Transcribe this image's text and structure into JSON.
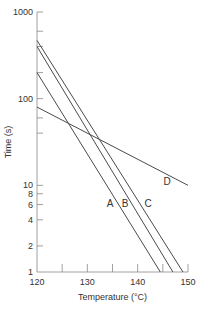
{
  "chart_data": {
    "type": "line",
    "title": "",
    "xlabel": "Temperature (°C)",
    "ylabel": "Time (s)",
    "xlim": [
      120,
      150
    ],
    "ylim": [
      1,
      1000
    ],
    "yscale": "log",
    "grid": false,
    "x_ticks": [
      120,
      125,
      130,
      135,
      140,
      145,
      150
    ],
    "x_tick_labels": [
      "120",
      "130",
      "140",
      "150"
    ],
    "y_tick_labels": [
      "1",
      "2",
      "4",
      "6",
      "8",
      "10",
      "100",
      "1000"
    ],
    "series": [
      {
        "name": "A",
        "x": [
          120,
          144.5
        ],
        "y": [
          200,
          1
        ]
      },
      {
        "name": "B",
        "x": [
          120,
          147
        ],
        "y": [
          400,
          1
        ]
      },
      {
        "name": "C",
        "x": [
          120,
          149
        ],
        "y": [
          470,
          1
        ]
      },
      {
        "name": "D",
        "x": [
          120,
          150
        ],
        "y": [
          80,
          10
        ]
      }
    ],
    "annotations": [
      "A",
      "B",
      "C",
      "D"
    ]
  },
  "colors": {
    "line": "#4a4a4a",
    "axis": "#888888",
    "text": "#333333"
  }
}
